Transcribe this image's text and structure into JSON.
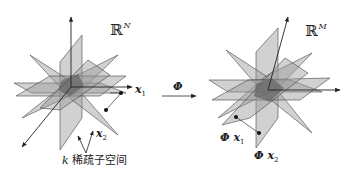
{
  "diagram": {
    "left": {
      "space_symbol": "ℝ",
      "space_dim": "N",
      "point1": {
        "name": "x",
        "index": "1"
      },
      "point2": {
        "name": "x",
        "index": "2"
      },
      "caption_k": "k",
      "caption_text": " 稀疏子空间"
    },
    "mapping": {
      "symbol": "Φ"
    },
    "right": {
      "space_symbol": "ℝ",
      "space_dim": "M",
      "point1": {
        "prefix": "Φ",
        "name": "x",
        "index": "1"
      },
      "point2": {
        "prefix": "Φ",
        "name": "x",
        "index": "2"
      }
    },
    "colors": {
      "plane_fill": "#9a9a9a",
      "plane_stroke": "#444444",
      "center_overlap": "#5a5a5a",
      "axis": "#222222",
      "point": "#111111"
    }
  }
}
